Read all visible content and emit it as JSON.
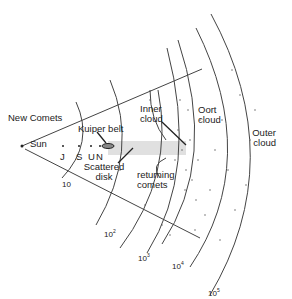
{
  "diagram": {
    "labels": {
      "new_comets": "New Comets",
      "sun": "Sun",
      "jupiter": "J",
      "saturn": "S",
      "uranus": "U",
      "neptune": "N",
      "kuiper_belt": "Kuiper belt",
      "scattered_disk": "Scattered disk",
      "inner_cloud": "Inner cloud",
      "oort_cloud": "Oort cloud",
      "outer_cloud": "Outer cloud",
      "returning_comets": "returning comets"
    },
    "distance_scale": {
      "base": "10",
      "ticks": [
        {
          "base": "10",
          "exp": ""
        },
        {
          "base": "10",
          "exp": "2"
        },
        {
          "base": "10",
          "exp": "3"
        },
        {
          "base": "10",
          "exp": "4"
        },
        {
          "base": "10",
          "exp": "5"
        }
      ]
    },
    "colors": {
      "line": "#333333",
      "band": "#d9d9d9"
    }
  }
}
